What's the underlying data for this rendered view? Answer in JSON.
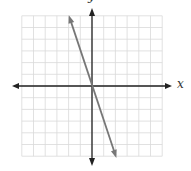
{
  "chart_data": {
    "type": "line",
    "title": "",
    "xlabel": "x",
    "ylabel": "y",
    "xlim": [
      -6,
      6
    ],
    "ylim": [
      -6,
      6
    ],
    "grid": true,
    "grid_step": 1,
    "tick_labels_shown": false,
    "series": [
      {
        "name": "line",
        "equation": "y = -3x",
        "slope": -3,
        "intercept": 0,
        "x": [
          -1.9,
          2
        ],
        "y": [
          5.8,
          -5.9
        ],
        "color": "#777777",
        "arrows_both_ends": true
      }
    ]
  },
  "labels": {
    "x": "x",
    "y": "y"
  },
  "colors": {
    "grid": "#d9d9d9",
    "axis": "#222222",
    "line": "#777777"
  }
}
